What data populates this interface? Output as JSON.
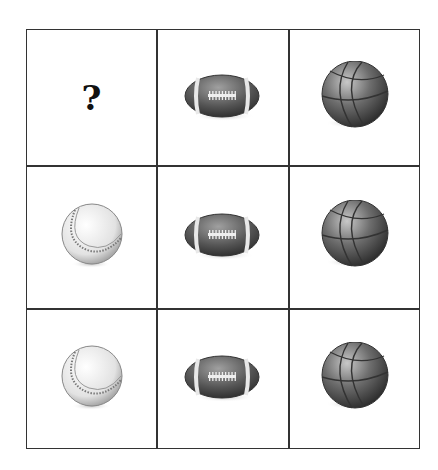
{
  "puzzle": {
    "rows": [
      [
        "question",
        "football",
        "basketball"
      ],
      [
        "baseball",
        "football",
        "basketball"
      ],
      [
        "baseball",
        "football",
        "basketball"
      ]
    ],
    "question_mark": "?"
  }
}
